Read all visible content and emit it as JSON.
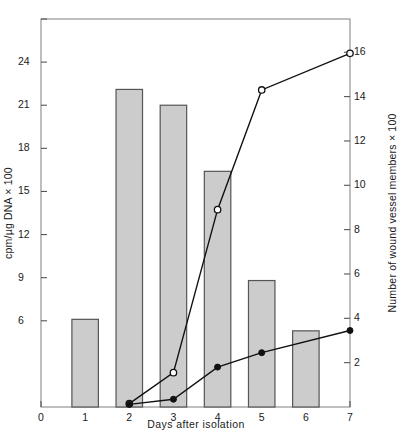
{
  "chart_data": {
    "type": "bar",
    "title": "",
    "subtitle": "",
    "xlabel": "Days after  isolation",
    "ylabel": "cpm/µg DNA × 100",
    "ylabel_right": "Number of wound vessel members × 100",
    "x": [
      1,
      2,
      3,
      4,
      5,
      6
    ],
    "categories": [
      "1",
      "2",
      "3",
      "4",
      "5",
      "6"
    ],
    "xlim": [
      0,
      7
    ],
    "ylim": [
      0,
      27
    ],
    "ylim_right": [
      0,
      17.5
    ],
    "grid": false,
    "legend": "none",
    "xticks": [
      0,
      1,
      2,
      3,
      4,
      5,
      6,
      7
    ],
    "xtick_labels": [
      "0",
      "1",
      "2",
      "3",
      "4",
      "5",
      "6",
      "7"
    ],
    "yticks_left": [
      6,
      9,
      12,
      15,
      18,
      21,
      24,
      27
    ],
    "ytick_labels_left": [
      "6",
      "9",
      "12",
      "15",
      "18",
      "21",
      "24",
      ""
    ],
    "yticks_right": [
      2,
      4,
      6,
      8,
      10,
      12,
      14,
      16
    ],
    "ytick_labels_right": [
      "2",
      "4",
      "6",
      "8",
      "10",
      "12",
      "14",
      "16"
    ],
    "bars": {
      "name": "cpm/µg DNA × 100",
      "axis": "left",
      "width": 0.6,
      "fill": "#cccccc",
      "edge": "#555555",
      "values": [
        6.1,
        22.1,
        21.0,
        16.4,
        8.8,
        5.3
      ]
    },
    "series": [
      {
        "name": "open-circle-line",
        "axis": "right",
        "marker": "open-circle",
        "color": "#111111",
        "x": [
          2,
          3,
          4,
          5,
          7
        ],
        "values": [
          0.15,
          1.55,
          8.9,
          14.3,
          15.95
        ]
      },
      {
        "name": "filled-circle-line",
        "axis": "right",
        "marker": "filled-circle",
        "color": "#111111",
        "x": [
          2,
          3,
          4,
          5,
          7
        ],
        "values": [
          0.12,
          0.35,
          1.8,
          2.45,
          3.45
        ]
      }
    ]
  },
  "figure": {
    "background": "#ffffff",
    "frame_color": "#8a8a8a",
    "axis_color": "#555555",
    "text_color": "#1a1a1a"
  }
}
